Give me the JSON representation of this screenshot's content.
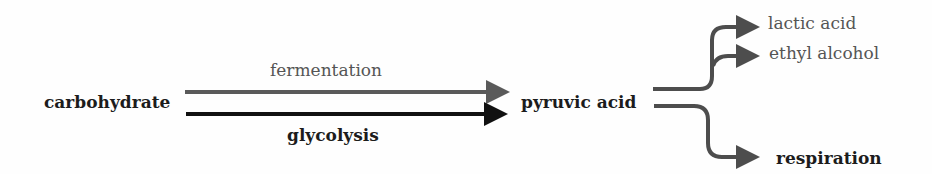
{
  "diagram": {
    "nodes": {
      "source": "carbohydrate",
      "intermediate": "pyruvic acid",
      "product_lactic": "lactic acid",
      "product_ethanol": "ethyl alcohol",
      "product_respiration": "respiration"
    },
    "edges": {
      "upper": "fermentation",
      "lower": "glycolysis"
    },
    "colors": {
      "fermentation": "#5a5a5a",
      "glycolysis": "#111111",
      "branches": "#4d4d4d",
      "text_dark": "#1c1c1c",
      "text_gray": "#555555"
    }
  }
}
